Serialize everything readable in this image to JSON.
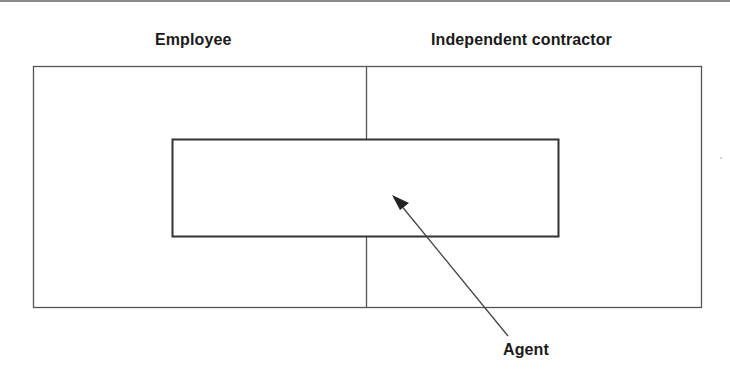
{
  "diagram": {
    "regions": [
      {
        "label": "Employee"
      },
      {
        "label": "Independent contractor"
      }
    ],
    "overlap": {
      "label": "Agent",
      "description": "Agent box spans both Employee and Independent contractor regions"
    }
  },
  "colors": {
    "stroke": "#555555",
    "inner_stroke": "#333333",
    "text": "#1a1a1a",
    "background": "#ffffff"
  }
}
